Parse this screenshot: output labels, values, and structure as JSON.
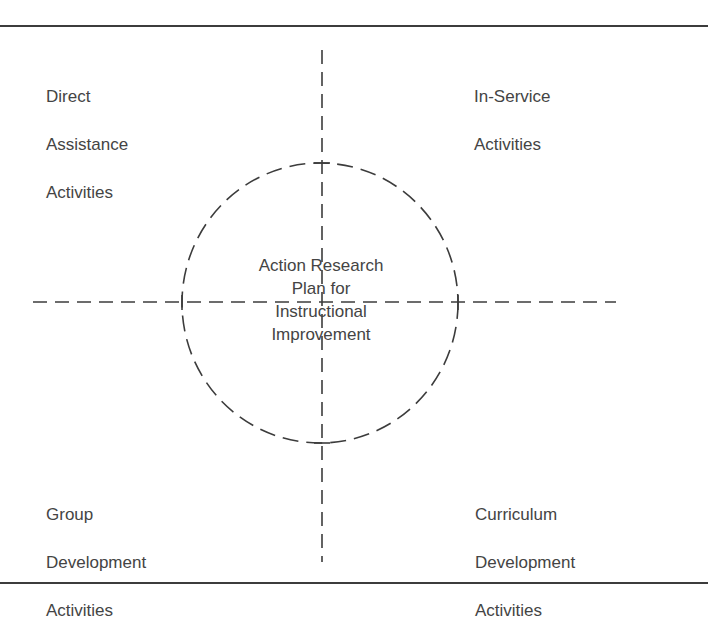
{
  "diagram": {
    "center": {
      "lines": [
        "Action Research",
        "Plan for",
        "Instructional",
        "Improvement"
      ]
    },
    "quadrants": {
      "top_left": {
        "lines": [
          "Direct",
          "Assistance",
          "Activities"
        ]
      },
      "top_right": {
        "lines": [
          "In-Service",
          "Activities"
        ]
      },
      "bottom_left": {
        "lines": [
          "Group",
          "Development",
          "Activities"
        ]
      },
      "bottom_right": {
        "lines": [
          "Curriculum",
          "Development",
          "Activities"
        ]
      }
    },
    "colors": {
      "line": "#3c3c3c",
      "text": "#444444",
      "background": "#ffffff"
    }
  }
}
